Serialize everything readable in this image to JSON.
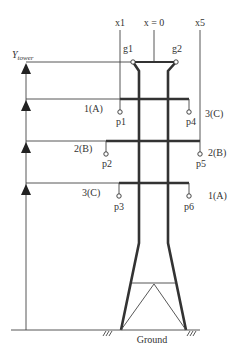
{
  "diagram": {
    "axis_labels": {
      "x1": "x1",
      "x0": "x = 0",
      "x5": "x5",
      "y_tower_main": "Y",
      "y_tower_sub": "tower"
    },
    "ground_wires": [
      {
        "id": "g1",
        "label": "g1"
      },
      {
        "id": "g2",
        "label": "g2"
      }
    ],
    "phases": [
      {
        "level": 1,
        "left_label": "1(A)",
        "right_label": "3(C)",
        "left_conductor": "p1",
        "right_conductor": "p4"
      },
      {
        "level": 2,
        "left_label": "2(B)",
        "right_label": "2(B)",
        "left_conductor": "p2",
        "right_conductor": "p5"
      },
      {
        "level": 3,
        "left_label": "3(C)",
        "right_label": "1(A)",
        "left_conductor": "p3",
        "right_conductor": "p6"
      }
    ],
    "ground_label": "Ground",
    "colors": {
      "line": "#333333",
      "background": "#ffffff"
    }
  }
}
